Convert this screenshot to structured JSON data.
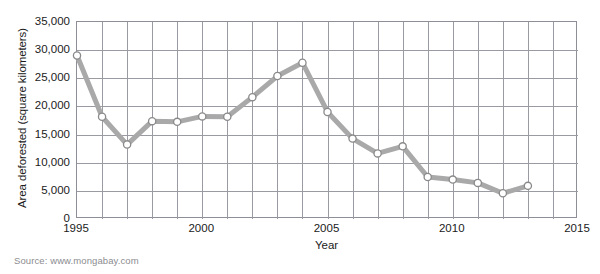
{
  "figure": {
    "source_note": "Source: www.mongabay.com"
  },
  "chart_data": {
    "type": "line",
    "title": "",
    "xlabel": "Year",
    "ylabel": "Area deforested (square kilometers)",
    "xlim": [
      1995,
      2015
    ],
    "ylim": [
      0,
      35000
    ],
    "xticks": [
      1995,
      2000,
      2005,
      2010,
      2015
    ],
    "xticklabels": [
      "1995",
      "2000",
      "2005",
      "2010",
      "2015"
    ],
    "yticks": [
      0,
      5000,
      10000,
      15000,
      20000,
      25000,
      30000,
      35000
    ],
    "yticklabels": [
      "0",
      "5,000",
      "10,000",
      "15,000",
      "20,000",
      "25,000",
      "30,000",
      "35,000"
    ],
    "grid": true,
    "grid_x_step": 1,
    "grid_y_step": 5000,
    "legend": null,
    "marker": "circle-open",
    "line_color": "#a9a9a9",
    "marker_edge_color": "#8a8a8a",
    "marker_face_color": "#ffffff",
    "grid_color": "#9a9aa2",
    "x": [
      1995,
      1996,
      1997,
      1998,
      1999,
      2000,
      2001,
      2002,
      2003,
      2004,
      2005,
      2006,
      2007,
      2008,
      2009,
      2010,
      2011,
      2012,
      2013
    ],
    "values": [
      29059,
      18161,
      13227,
      17383,
      17259,
      18226,
      18165,
      21651,
      25396,
      27772,
      19014,
      14286,
      11651,
      12911,
      7464,
      7000,
      6418,
      4571,
      5891
    ],
    "series": [
      {
        "name": "Area deforested",
        "values": [
          29059,
          18161,
          13227,
          17383,
          17259,
          18226,
          18165,
          21651,
          25396,
          27772,
          19014,
          14286,
          11651,
          12911,
          7464,
          7000,
          6418,
          4571,
          5891
        ]
      }
    ]
  }
}
